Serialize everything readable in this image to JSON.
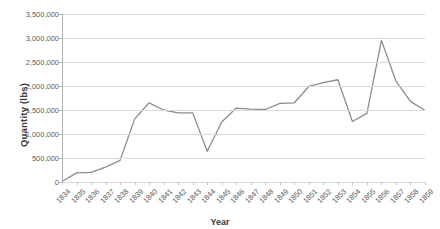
{
  "chart_data": {
    "type": "line",
    "title": "",
    "xlabel": "Year",
    "ylabel": "Quantity (lbs)",
    "ylim": [
      0,
      3500000
    ],
    "ytick_labels": [
      "0",
      "500,000",
      "1,000,000",
      "1,500,000",
      "2,000,000",
      "2,500,000",
      "3,000,000",
      "3,500,000"
    ],
    "ytick_values": [
      0,
      500000,
      1000000,
      1500000,
      2000000,
      2500000,
      3000000,
      3500000
    ],
    "grid": true,
    "legend": "none",
    "line_color": "#8c8c8c",
    "categories": [
      "1834",
      "1835",
      "1836",
      "1837",
      "1838",
      "1839",
      "1840",
      "1841",
      "1842",
      "1843",
      "1844",
      "1845",
      "1846",
      "1847",
      "1848",
      "1849",
      "1850",
      "1851",
      "1852",
      "1853",
      "1854",
      "1855",
      "1856",
      "1857",
      "1858",
      "1859"
    ],
    "values": [
      10000,
      190000,
      200000,
      310000,
      450000,
      1310000,
      1650000,
      1500000,
      1440000,
      1440000,
      640000,
      1250000,
      1540000,
      1520000,
      1510000,
      1640000,
      1650000,
      1990000,
      2070000,
      2130000,
      1260000,
      1430000,
      2950000,
      2100000,
      1680000,
      1490000
    ]
  }
}
